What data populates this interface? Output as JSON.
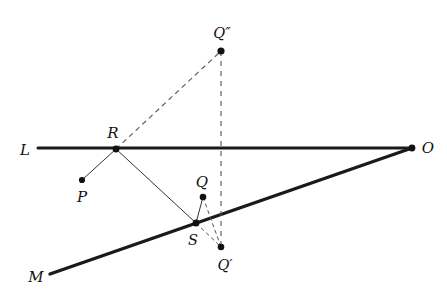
{
  "diagram": {
    "background_color": "#ffffff",
    "stroke_color": "#1a1a1a",
    "dash_color": "#555555",
    "canvas": {
      "width": 447,
      "height": 298
    },
    "labels": {
      "L": "L",
      "M": "M",
      "O": "O",
      "P": "P",
      "Q": "Q",
      "R": "R",
      "S": "S",
      "Q_prime": "Q′",
      "Q_double_prime": "Q″"
    },
    "label_positions": {
      "L": {
        "x": 25,
        "y": 150
      },
      "M": {
        "x": 36,
        "y": 277
      },
      "O": {
        "x": 428,
        "y": 148
      },
      "P": {
        "x": 82,
        "y": 197
      },
      "Q": {
        "x": 202,
        "y": 182
      },
      "R": {
        "x": 113,
        "y": 133
      },
      "S": {
        "x": 193,
        "y": 240
      },
      "Q_prime": {
        "x": 225,
        "y": 265
      },
      "Q_double_prime": {
        "x": 222,
        "y": 33
      }
    },
    "points": [
      {
        "name": "P",
        "x": 82,
        "y": 180,
        "radius": 3.1
      },
      {
        "name": "R",
        "x": 116,
        "y": 149,
        "radius": 3.4
      },
      {
        "name": "Q",
        "x": 203,
        "y": 197,
        "radius": 3.3
      },
      {
        "name": "S",
        "x": 196,
        "y": 223,
        "radius": 3.4
      },
      {
        "name": "Q_prime",
        "x": 221,
        "y": 247,
        "radius": 3.3
      },
      {
        "name": "Q_double_prime",
        "x": 221,
        "y": 51,
        "radius": 3.6
      },
      {
        "name": "O",
        "x": 412,
        "y": 148,
        "radius": 3.4
      }
    ],
    "lines": [
      {
        "name": "line-L",
        "from": {
          "x": 38,
          "y": 148
        },
        "to": {
          "x": 412,
          "y": 148
        },
        "style": "solid",
        "width": 3.0
      },
      {
        "name": "line-M",
        "from": {
          "x": 50,
          "y": 274
        },
        "to": {
          "x": 412,
          "y": 148
        },
        "style": "solid",
        "width": 3.4
      },
      {
        "name": "segment-P-R",
        "from": {
          "x": 82,
          "y": 180
        },
        "to": {
          "x": 116,
          "y": 149
        },
        "style": "solid",
        "width": 1.0
      },
      {
        "name": "segment-R-S",
        "from": {
          "x": 116,
          "y": 149
        },
        "to": {
          "x": 196,
          "y": 223
        },
        "style": "solid",
        "width": 1.0
      },
      {
        "name": "segment-S-Q",
        "from": {
          "x": 196,
          "y": 223
        },
        "to": {
          "x": 203,
          "y": 197
        },
        "style": "solid",
        "width": 1.0
      },
      {
        "name": "dashed-R-Qdouble",
        "from": {
          "x": 116,
          "y": 149
        },
        "to": {
          "x": 221,
          "y": 51
        },
        "style": "dashed",
        "width": 1.1
      },
      {
        "name": "dashed-vertical-Qdouble-Qprime",
        "from": {
          "x": 221,
          "y": 51
        },
        "to": {
          "x": 221,
          "y": 247
        },
        "style": "dashed",
        "width": 1.1
      },
      {
        "name": "dashed-S-Qprime",
        "from": {
          "x": 196,
          "y": 223
        },
        "to": {
          "x": 221,
          "y": 247
        },
        "style": "dashed",
        "width": 1.0
      },
      {
        "name": "dashed-Q-Qprime",
        "from": {
          "x": 203,
          "y": 197
        },
        "to": {
          "x": 221,
          "y": 247
        },
        "style": "dashed",
        "width": 1.0
      }
    ]
  }
}
